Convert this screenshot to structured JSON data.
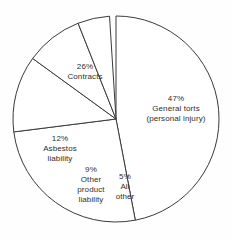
{
  "chart_data": {
    "type": "pie",
    "title": "",
    "subtitle": "",
    "xlabel": "",
    "ylabel": "",
    "legend_position": "none",
    "grid": false,
    "units": "percent",
    "start_angle_deg": 0,
    "direction": "clockwise",
    "center": {
      "x": 116,
      "y": 119
    },
    "radius": 103,
    "categories": [
      "General torts (personal injury)",
      "Contracts",
      "Asbestos liability",
      "Other product liability",
      "All other"
    ],
    "values": [
      47,
      26,
      12,
      9,
      5
    ],
    "slices": [
      {
        "name": "general-torts",
        "percent_label": "47%",
        "value": 47,
        "label_line1": "General torts",
        "label_line2": "(personal injury)",
        "start_deg": 0,
        "sweep_deg": 169.2
      },
      {
        "name": "contracts",
        "percent_label": "26%",
        "value": 26,
        "label_line1": "Contracts",
        "label_line2": "",
        "start_deg": 169.2,
        "sweep_deg": 93.6
      },
      {
        "name": "asbestos-liability",
        "percent_label": "12%",
        "value": 12,
        "label_line1": "Asbestos",
        "label_line2": "liability",
        "start_deg": 262.8,
        "sweep_deg": 43.2
      },
      {
        "name": "other-product-liability",
        "percent_label": "9%",
        "value": 9,
        "label_line1": "Other",
        "label_line2": "product",
        "label_line3": "liability",
        "start_deg": 306.0,
        "sweep_deg": 32.4
      },
      {
        "name": "all-other",
        "percent_label": "5%",
        "value": 5,
        "label_line1": "All",
        "label_line2": "other",
        "start_deg": 338.4,
        "sweep_deg": 18.0
      }
    ],
    "colors": {
      "slice_fill": "#ffffff",
      "slice_stroke": "#3a3a3a",
      "label_text": "#2e2e2e",
      "background": "#fefefe"
    }
  }
}
